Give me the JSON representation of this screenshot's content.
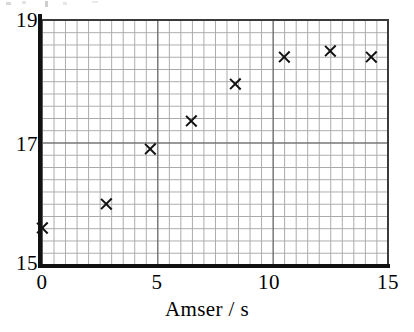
{
  "chart_data": {
    "type": "scatter",
    "title": "",
    "xlabel": "Amser / s",
    "ylabel": "",
    "xlim": [
      0,
      15
    ],
    "ylim": [
      15,
      19
    ],
    "x_ticks": [
      "0",
      "5",
      "10",
      "15"
    ],
    "x_tick_values": [
      0,
      5,
      10,
      15
    ],
    "y_ticks": [
      "19",
      "17",
      "15"
    ],
    "y_tick_values": [
      19,
      17,
      15
    ],
    "grid": true,
    "grid_major_x_step": 5,
    "grid_major_y_step": 2,
    "grid_minor_x_step": 0.5,
    "grid_minor_y_step": 0.2,
    "legend": null,
    "marker": "x",
    "marker_color": "#111111",
    "points": [
      {
        "x": 0.0,
        "y": 15.6
      },
      {
        "x": 2.8,
        "y": 16.0
      },
      {
        "x": 4.7,
        "y": 16.9
      },
      {
        "x": 6.5,
        "y": 17.35
      },
      {
        "x": 8.4,
        "y": 17.95
      },
      {
        "x": 10.5,
        "y": 18.4
      },
      {
        "x": 12.5,
        "y": 18.5
      },
      {
        "x": 14.3,
        "y": 18.4
      }
    ],
    "x_values": [
      0.0,
      2.8,
      4.7,
      6.5,
      8.4,
      10.5,
      12.5,
      14.3
    ],
    "y_values": [
      15.6,
      16.0,
      16.9,
      17.35,
      17.95,
      18.4,
      18.5,
      18.4
    ]
  },
  "axes": {
    "x_label": "Amser / s",
    "x_tick_labels": [
      "0",
      "5",
      "10",
      "15"
    ],
    "y_tick_labels": [
      "19",
      "17",
      "15"
    ]
  },
  "colors": {
    "marker": "#111111",
    "axis": "#111111",
    "grid_major": "#5a5a5a",
    "grid_minor": "#a8a8a8",
    "background": "#ffffff"
  }
}
